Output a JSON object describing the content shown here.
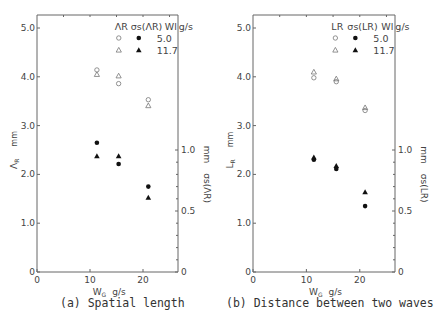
{
  "chart_data": [
    {
      "type": "scatter",
      "panel": "a",
      "caption": "(a) Spatial length",
      "xlabel": "W_G  g/s",
      "xlabel_main": "W",
      "xlabel_sub": "G",
      "xlabel_unit": "g/s",
      "xlim": [
        0,
        26.6
      ],
      "xticks": [
        0,
        10,
        20
      ],
      "ylabel_left": "Λ_R  mm",
      "ylabel_left_main": "Λ",
      "ylabel_left_sub": "R",
      "ylabel_left_unit": "mm",
      "ylim_left": [
        0,
        5.0
      ],
      "yticks_left": [
        "0",
        "1.0",
        "2.0",
        "3.0",
        "4.0",
        "5.0"
      ],
      "ylabel_right": "σs(Λ_R)  mm",
      "ylabel_right_main": "σs(ΛR)",
      "ylabel_right_unit": "mm",
      "ylim_right": [
        0,
        1.0
      ],
      "yticks_right": [
        "0",
        "0.5",
        "1.0"
      ],
      "legend": {
        "col1": "ΛR",
        "col2": "σs(ΛR)",
        "col3": "Wl",
        "unit": "g/s",
        "rows": [
          {
            "wl": "5.0",
            "open_marker": "circle",
            "filled_marker": "circle"
          },
          {
            "wl": "11.7",
            "open_marker": "triangle",
            "filled_marker": "triangle"
          }
        ]
      },
      "series": [
        {
          "name": "ΛR, Wl=5.0",
          "marker": "open-circle",
          "axis": "left",
          "x": [
            11.3,
            15.4,
            21.0
          ],
          "y": [
            4.14,
            3.86,
            3.53
          ]
        },
        {
          "name": "ΛR, Wl=11.7",
          "marker": "open-triangle",
          "axis": "left",
          "x": [
            11.3,
            15.4,
            21.0
          ],
          "y": [
            4.05,
            4.02,
            3.41
          ]
        },
        {
          "name": "σs(ΛR), Wl=5.0",
          "marker": "filled-circle",
          "axis": "right",
          "x": [
            11.3,
            15.4,
            21.0
          ],
          "y": [
            1.06,
            0.885,
            0.7
          ]
        },
        {
          "name": "σs(ΛR), Wl=11.7",
          "marker": "filled-triangle",
          "axis": "right",
          "x": [
            11.3,
            15.4,
            21.0
          ],
          "y": [
            0.95,
            0.95,
            0.61
          ]
        }
      ]
    },
    {
      "type": "scatter",
      "panel": "b",
      "caption": "(b) Distance between two waves",
      "xlabel": "W_G  g/s",
      "xlabel_main": "W",
      "xlabel_sub": "G",
      "xlabel_unit": "g/s",
      "xlim": [
        0,
        26.6
      ],
      "xticks": [
        0,
        10,
        20
      ],
      "ylabel_left": "L_R  mm",
      "ylabel_left_main": "L",
      "ylabel_left_sub": "R",
      "ylabel_left_unit": "mm",
      "ylim_left": [
        0,
        5.0
      ],
      "yticks_left": [
        "0",
        "1.0",
        "2.0",
        "3.0",
        "4.0",
        "5.0"
      ],
      "ylabel_right": "σs(L_R)  mm",
      "ylabel_right_main": "σs(LR)",
      "ylabel_right_unit": "mm",
      "ylim_right": [
        0,
        1.0
      ],
      "yticks_right": [
        "0",
        "0.5",
        "1.0"
      ],
      "legend": {
        "col1": "LR",
        "col2": "σs(LR)",
        "col3": "Wl",
        "unit": "g/s",
        "rows": [
          {
            "wl": "5.0",
            "open_marker": "circle",
            "filled_marker": "circle"
          },
          {
            "wl": "11.7",
            "open_marker": "triangle",
            "filled_marker": "triangle"
          }
        ]
      },
      "series": [
        {
          "name": "LR, Wl=5.0",
          "marker": "open-circle",
          "axis": "left",
          "x": [
            11.4,
            15.6,
            21.0
          ],
          "y": [
            3.98,
            3.9,
            3.31
          ]
        },
        {
          "name": "LR, Wl=11.7",
          "marker": "open-triangle",
          "axis": "left",
          "x": [
            11.4,
            15.6,
            21.0
          ],
          "y": [
            4.1,
            3.96,
            3.37
          ]
        },
        {
          "name": "σs(LR), Wl=5.0",
          "marker": "filled-circle",
          "axis": "right",
          "x": [
            11.4,
            15.6,
            21.0
          ],
          "y": [
            0.92,
            0.845,
            0.54
          ]
        },
        {
          "name": "σs(LR), Wl=11.7",
          "marker": "filled-triangle",
          "axis": "right",
          "x": [
            11.4,
            15.6,
            21.0
          ],
          "y": [
            0.94,
            0.87,
            0.656
          ]
        }
      ]
    }
  ]
}
